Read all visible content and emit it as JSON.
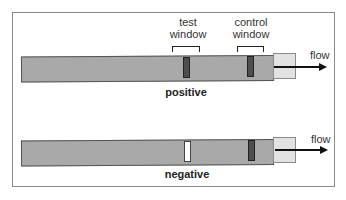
{
  "diagram": {
    "labels": {
      "test_window": [
        "test",
        "window"
      ],
      "control_window": [
        "control",
        "window"
      ],
      "flow": "flow"
    },
    "rows": [
      {
        "caption": "positive",
        "test_line": "present",
        "control_line": "present"
      },
      {
        "caption": "negative",
        "test_line": "absent",
        "control_line": "present"
      }
    ],
    "colors": {
      "strip": "#a9a9a9",
      "pad": "#e2e2e2",
      "line": "#4e4e4e",
      "empty_window": "#ffffff",
      "frame": "#8a8a8a"
    }
  }
}
